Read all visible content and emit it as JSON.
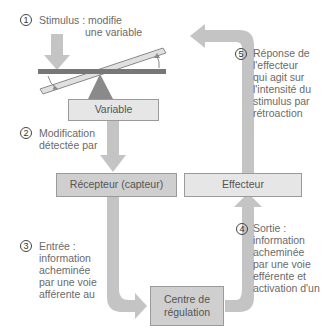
{
  "steps": [
    {
      "number": "1",
      "lines": [
        "Stimulus : modifie",
        "une variable"
      ]
    },
    {
      "number": "2",
      "lines": [
        "Modification",
        "détectée par"
      ]
    },
    {
      "number": "3",
      "lines": [
        "Entrée :",
        "information",
        "acheminée",
        "par une voie",
        "afférente au"
      ]
    },
    {
      "number": "4",
      "lines": [
        "Sortie :",
        "information",
        "acheminée",
        "par une voie",
        "efférente et",
        "activation d'un"
      ]
    },
    {
      "number": "5",
      "lines": [
        "Réponse de",
        "l'effecteur",
        "qui agit sur",
        "l'intensité du",
        "stimulus par",
        "rétroaction"
      ]
    }
  ],
  "boxes": {
    "variable": "Variable",
    "receptor": "Récepteur (capteur)",
    "effector": "Effecteur",
    "control_center": [
      "Centre de",
      "régulation"
    ]
  },
  "colors": {
    "arrow": "#c4c4c4",
    "lever": "#777777",
    "fulcrum": "#8a8a8a",
    "box_light": "#e6e6e6",
    "box_mid": "#cfcfcf"
  }
}
